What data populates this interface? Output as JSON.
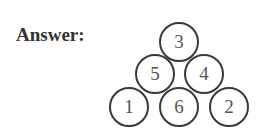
{
  "label": "Answer:",
  "pyramid": {
    "rows": [
      [
        "3"
      ],
      [
        "5",
        "4"
      ],
      [
        "1",
        "6",
        "2"
      ]
    ],
    "circles": [
      {
        "value": "3",
        "cx": 179,
        "cy": 42
      },
      {
        "value": "5",
        "cx": 155,
        "cy": 74
      },
      {
        "value": "4",
        "cx": 204,
        "cy": 74
      },
      {
        "value": "1",
        "cx": 129,
        "cy": 107
      },
      {
        "value": "6",
        "cx": 179,
        "cy": 107
      },
      {
        "value": "2",
        "cx": 229,
        "cy": 107
      }
    ]
  }
}
